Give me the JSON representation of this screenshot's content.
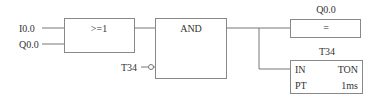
{
  "diagram": {
    "type": "function-block-diagram",
    "inputs": [
      {
        "label": "I0.0"
      },
      {
        "label": "Q0.0"
      }
    ],
    "or_block": {
      "label": ">=1"
    },
    "and_block": {
      "label": "AND",
      "negated_input": {
        "label": "T34"
      }
    },
    "coil": {
      "address": "Q0.0",
      "label": "="
    },
    "timer": {
      "name": "T34",
      "in_label": "IN",
      "type_label": "TON",
      "pt_label": "PT",
      "resolution": "1ms"
    },
    "colors": {
      "line": "#777777",
      "text": "#333333",
      "background": "#ffffff"
    }
  }
}
